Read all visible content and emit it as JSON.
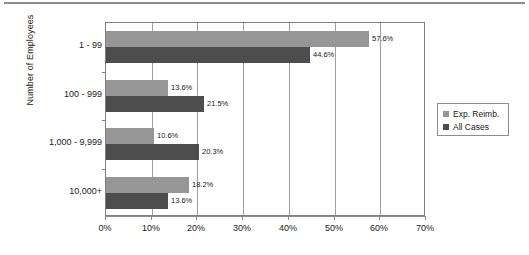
{
  "chart_data": {
    "type": "bar",
    "orientation": "horizontal",
    "title": "",
    "xlabel": "",
    "ylabel": "Number of Employees",
    "categories": [
      "1 - 99",
      "100 - 999",
      "1,000 - 9,999",
      "10,000+"
    ],
    "series": [
      {
        "name": "Exp. Reimb.",
        "color": "#969696",
        "values": [
          57.6,
          13.6,
          10.6,
          18.2
        ],
        "labels": [
          "57.6%",
          "13.6%",
          "10.6%",
          "18.2%"
        ]
      },
      {
        "name": "All Cases",
        "color": "#4d4d4d",
        "values": [
          44.6,
          21.5,
          20.3,
          13.6
        ],
        "labels": [
          "44.6%",
          "21.5%",
          "20.3%",
          "13.6%"
        ]
      }
    ],
    "xlim": [
      0,
      70
    ],
    "xticks": [
      0,
      10,
      20,
      30,
      40,
      50,
      60,
      70
    ],
    "xtick_labels": [
      "0%",
      "10%",
      "20%",
      "30%",
      "40%",
      "50%",
      "60%",
      "70%"
    ],
    "grid": "vertical",
    "legend_position": "right",
    "legend_entries": [
      "Exp. Reimb.",
      "All Cases"
    ]
  },
  "axis": {
    "y_title": "Number of Employees"
  }
}
